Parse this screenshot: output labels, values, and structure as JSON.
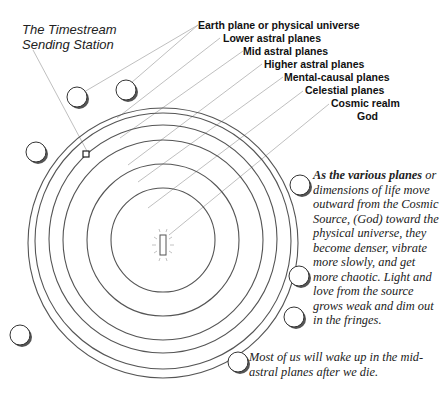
{
  "diagram": {
    "station_label_line1": "The Timestream",
    "station_label_line2": "Sending Station",
    "planes": [
      {
        "label": "Earth plane or physical universe"
      },
      {
        "label": "Lower astral planes"
      },
      {
        "label": "Mid astral planes"
      },
      {
        "label": "Higher astral planes"
      },
      {
        "label": "Mental-causal planes"
      },
      {
        "label": "Celestial planes"
      },
      {
        "label": "Cosmic realm"
      },
      {
        "label": "God"
      }
    ],
    "description_lead": "As the various planes",
    "description_body": "or dimensions of life move outward from the Cosmic Source, (God) toward the physical universe, they become denser, vibrate more slowly, and get more chaotic. Light and love from the source grows weak and dim out in the fringes.",
    "footnote": "Most of us will wake up in the mid-astral planes after we die.",
    "colors": {
      "ring": "#555555",
      "leader": "#b0b0b0",
      "text": "#111111"
    }
  }
}
